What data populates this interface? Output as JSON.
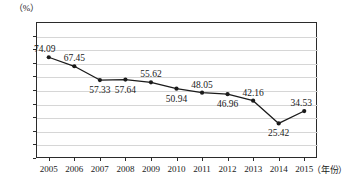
{
  "chart_data": {
    "type": "line",
    "title": "",
    "xlabel": "（年份）",
    "ylabel": "（%）",
    "categories": [
      "2005",
      "2006",
      "2007",
      "2008",
      "2009",
      "2010",
      "2011",
      "2012",
      "2013",
      "2014",
      "2015"
    ],
    "values": [
      74.09,
      67.45,
      57.33,
      57.64,
      55.62,
      50.94,
      48.05,
      46.96,
      42.16,
      25.42,
      34.53
    ],
    "point_labels": [
      "74.09",
      "67.45",
      "57.33",
      "57.64",
      "55.62",
      "50.94",
      "48.05",
      "46.96",
      "42.16",
      "25.42",
      "34.53"
    ],
    "label_positions": [
      "above",
      "above",
      "below",
      "below",
      "above",
      "below",
      "above",
      "below",
      "above",
      "below",
      "above"
    ],
    "ylim": [
      0,
      100
    ],
    "y_ticks": [
      "0",
      "10",
      "20",
      "30",
      "40",
      "50",
      "60",
      "70",
      "80",
      "90",
      "100"
    ],
    "grid": true,
    "legend": "none",
    "series_color": "#1a1a1a",
    "grid_color": "#d6d6d6",
    "axis_color": "#2b2b2b",
    "marker": "filled-circle"
  }
}
